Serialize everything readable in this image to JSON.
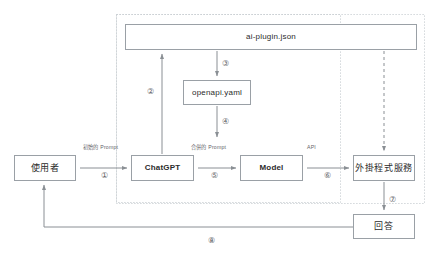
{
  "diagram": {
    "style": {
      "node_border": "#9aa0a6",
      "node_background": "#ffffff",
      "text_color": "#2b2b2b",
      "label_color": "#5f6368",
      "line_color": "#8a8f94",
      "group_border": "#c7ccd1",
      "canvas_background": "#ffffff"
    },
    "nodes": [
      {
        "id": "ai-plugin",
        "label": "ai-plugin.json",
        "shape": "rectangle"
      },
      {
        "id": "openapi",
        "label": "openapi.yaml",
        "shape": "rectangle"
      },
      {
        "id": "user",
        "label": "使用者",
        "shape": "rectangle"
      },
      {
        "id": "chatgpt",
        "label": "ChatGPT",
        "shape": "rectangle"
      },
      {
        "id": "model",
        "label": "Model",
        "shape": "rectangle"
      },
      {
        "id": "plugin-svc",
        "label": "外掛程式服務",
        "shape": "rectangle"
      },
      {
        "id": "answer",
        "label": "回答",
        "shape": "rectangle"
      }
    ],
    "edge_labels": {
      "prompt_initial": "初始的 Prompt",
      "prompt_merged": "合併的 Prompt",
      "api": "API"
    },
    "steps": [
      {
        "number": "①",
        "from": "user",
        "to": "chatgpt"
      },
      {
        "number": "②",
        "from": "chatgpt",
        "to": "ai-plugin"
      },
      {
        "number": "③",
        "from": "ai-plugin",
        "to": "openapi"
      },
      {
        "number": "④",
        "from": "openapi",
        "to": "chatgpt"
      },
      {
        "number": "⑤",
        "from": "chatgpt",
        "to": "model"
      },
      {
        "number": "⑥",
        "from": "model",
        "to": "plugin-svc"
      },
      {
        "number": "⑦",
        "from": "plugin-svc",
        "to": "answer"
      },
      {
        "number": "⑧",
        "from": "answer",
        "to": "user"
      }
    ],
    "groups": [
      {
        "id": "outer-group",
        "border_style": "dotted"
      },
      {
        "id": "inner-group",
        "border_style": "dotted"
      }
    ]
  }
}
